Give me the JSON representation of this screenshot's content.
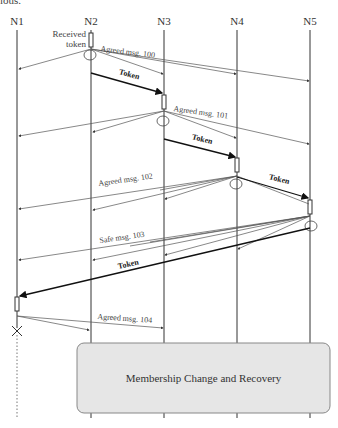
{
  "top_fragment": "ious.",
  "nodes": [
    {
      "id": "N1",
      "label": "N1",
      "x": 17
    },
    {
      "id": "N2",
      "label": "N2",
      "x": 91
    },
    {
      "id": "N3",
      "label": "N3",
      "x": 164
    },
    {
      "id": "N4",
      "label": "N4",
      "x": 237
    },
    {
      "id": "N5",
      "label": "N5",
      "x": 310
    }
  ],
  "annotations": {
    "received_token": "Received\ntoken",
    "received_line1": "Received",
    "received_line2": "token"
  },
  "messages": [
    {
      "type": "agreed",
      "label": "Agreed msg. 100",
      "from": "N2"
    },
    {
      "type": "token",
      "label": "Token",
      "from": "N2",
      "to": "N3"
    },
    {
      "type": "agreed",
      "label": "Agreed msg. 101",
      "from": "N3"
    },
    {
      "type": "token",
      "label": "Token",
      "from": "N3",
      "to": "N4"
    },
    {
      "type": "agreed",
      "label": "Agreed msg. 102",
      "from": "N4"
    },
    {
      "type": "token",
      "label": "Token",
      "from": "N4",
      "to": "N5"
    },
    {
      "type": "safe",
      "label": "Safe msg. 103",
      "from": "N5"
    },
    {
      "type": "token",
      "label": "Token",
      "from": "N5",
      "to": "N1"
    },
    {
      "type": "agreed",
      "label": "Agreed msg. 104",
      "from": "N1"
    }
  ],
  "labels": {
    "m100": "Agreed msg. 100",
    "t1": "Token",
    "m101": "Agreed msg. 101",
    "t2": "Token",
    "m102": "Agreed msg. 102",
    "t3": "Token",
    "m103": "Safe msg. 103",
    "t4": "Token",
    "m104": "Agreed msg. 104"
  },
  "failure": {
    "node": "N1",
    "marker": "X"
  },
  "box": {
    "label": "Membership Change and Recovery",
    "fill": "#e6e6e6",
    "stroke": "#888888"
  }
}
